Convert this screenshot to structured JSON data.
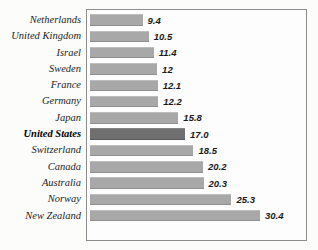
{
  "chart_data": {
    "type": "bar",
    "orientation": "horizontal",
    "title": "",
    "xlabel": "",
    "ylabel": "",
    "grid": false,
    "legend": null,
    "xlim": [
      0,
      30.4
    ],
    "categories": [
      "Netherlands",
      "United Kingdom",
      "Israel",
      "Sweden",
      "France",
      "Germany",
      "Japan",
      "United States",
      "Switzerland",
      "Canada",
      "Australia",
      "Norway",
      "New Zealand"
    ],
    "values": [
      9.4,
      10.5,
      11.4,
      12,
      12.1,
      12.2,
      15.8,
      17.0,
      18.5,
      20.2,
      20.3,
      25.3,
      30.4
    ],
    "value_labels": [
      "9.4",
      "10.5",
      "11.4",
      "12",
      "12.1",
      "12.2",
      "15.8",
      "17.0",
      "18.5",
      "20.2",
      "20.3",
      "25.3",
      "30.4"
    ],
    "highlighted_category": "United States",
    "colors": {
      "bar": "#a8a8a8",
      "bar_highlight": "#6f6f6f",
      "frame": "#8d8d8d",
      "text": "#1d1d1d",
      "background": "#fcfcfb"
    }
  }
}
